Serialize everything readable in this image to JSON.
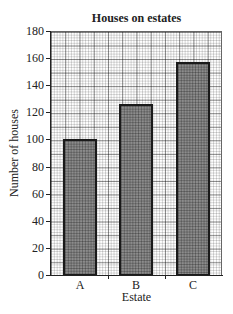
{
  "chart_data": {
    "type": "bar",
    "title": "Houses on estates",
    "xlabel": "Estate",
    "ylabel": "Number of houses",
    "categories": [
      "A",
      "B",
      "C"
    ],
    "values": [
      100,
      126,
      157
    ],
    "ylim": [
      0,
      180
    ],
    "yticks": [
      0,
      20,
      40,
      60,
      80,
      100,
      120,
      140,
      160,
      180
    ],
    "grid": true,
    "grid_minor_step": 2,
    "bar_color": "#8c8c8c",
    "legend": null
  },
  "labels": {
    "title": "Houses on estates",
    "xlabel": "Estate",
    "ylabel": "Number of houses",
    "yticks": [
      "0",
      "20",
      "40",
      "60",
      "80",
      "100",
      "120",
      "140",
      "160",
      "180"
    ],
    "categories": [
      "A",
      "B",
      "C"
    ]
  }
}
